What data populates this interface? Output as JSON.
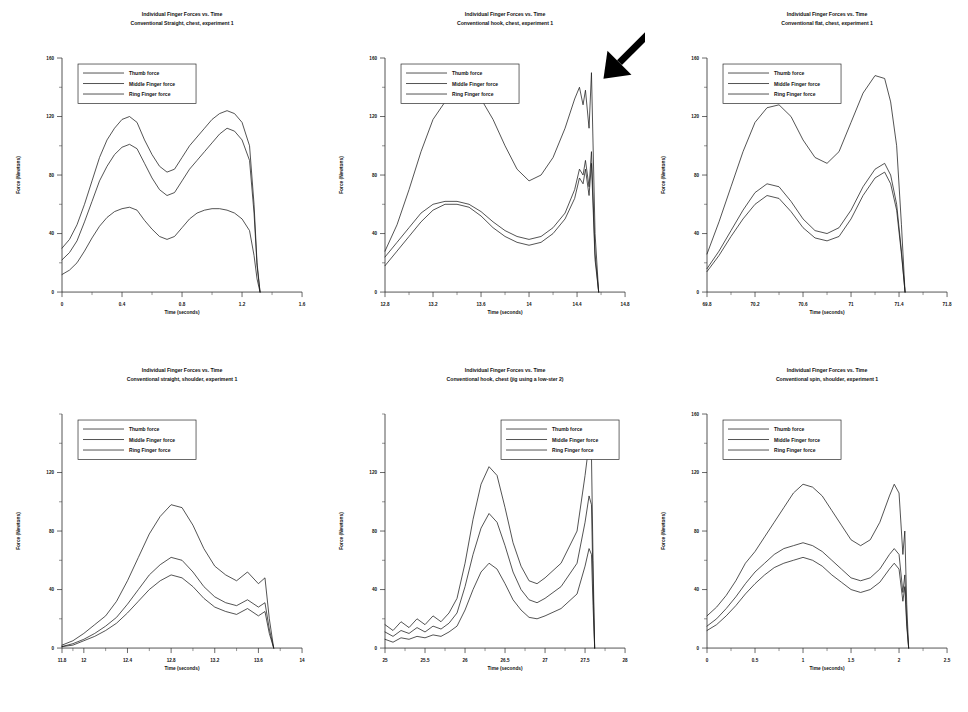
{
  "figure": {
    "caption_shared": {
      "title_line1": "Individual Finger Forces vs. Time",
      "ylabel": "Force (Newtons)",
      "xlabel": "Time (seconds)",
      "legend": [
        "Thumb force",
        "Middle Finger force",
        "Ring Finger force"
      ]
    }
  },
  "chart_data": [
    {
      "id": "panel-1",
      "type": "line",
      "title": "Individual Finger Forces vs. Time",
      "subtitle": "Conventional Straight, chest, experiment 1",
      "xlabel": "Time (seconds)",
      "ylabel": "Force (Newtons)",
      "xlim": [
        0,
        1.6
      ],
      "ylim": [
        0,
        160
      ],
      "xticks": [
        "0",
        "0.4",
        "0.8",
        "1.2",
        "1.6"
      ],
      "yticks": [
        "0",
        "40",
        "80",
        "120",
        "160"
      ],
      "grid": false,
      "legend_position": "upper-left",
      "legend": [
        "Thumb force",
        "Middle Finger force",
        "Ring Finger force"
      ],
      "x": [
        0.0,
        0.05,
        0.1,
        0.15,
        0.2,
        0.25,
        0.3,
        0.35,
        0.4,
        0.45,
        0.5,
        0.55,
        0.6,
        0.65,
        0.7,
        0.75,
        0.8,
        0.85,
        0.9,
        0.95,
        1.0,
        1.05,
        1.1,
        1.15,
        1.2,
        1.25,
        1.28,
        1.3,
        1.32
      ],
      "series": [
        {
          "name": "Thumb force",
          "values": [
            30,
            36,
            46,
            60,
            76,
            92,
            104,
            112,
            118,
            120,
            116,
            104,
            94,
            86,
            82,
            84,
            92,
            100,
            106,
            112,
            118,
            122,
            124,
            122,
            116,
            100,
            60,
            20,
            0
          ]
        },
        {
          "name": "Middle Finger force",
          "values": [
            22,
            27,
            35,
            48,
            62,
            76,
            86,
            94,
            99,
            101,
            98,
            88,
            78,
            70,
            66,
            68,
            76,
            84,
            90,
            96,
            102,
            108,
            112,
            110,
            104,
            90,
            54,
            18,
            0
          ]
        },
        {
          "name": "Ring Finger force",
          "values": [
            12,
            15,
            20,
            28,
            37,
            45,
            51,
            55,
            57,
            58,
            56,
            49,
            43,
            38,
            36,
            38,
            44,
            50,
            54,
            56,
            57,
            57,
            56,
            54,
            50,
            42,
            25,
            9,
            0
          ]
        }
      ]
    },
    {
      "id": "panel-2",
      "type": "line",
      "title": "Individual Finger Forces vs. Time",
      "subtitle": "Conventional hook, chest, experiment 1",
      "xlabel": "Time (seconds)",
      "ylabel": "Force (Newtons)",
      "xlim": [
        12.8,
        14.8
      ],
      "ylim": [
        0,
        160
      ],
      "xticks": [
        "12.8",
        "13.2",
        "13.6",
        "14",
        "14.4",
        "14.8"
      ],
      "yticks": [
        "0",
        "40",
        "80",
        "120",
        "160"
      ],
      "grid": false,
      "legend_position": "upper-left",
      "legend": [
        "Thumb force",
        "Middle Finger force",
        "Ring Finger force"
      ],
      "annotation": "black arrow pointing to spike near t = 14.45 s",
      "x": [
        12.8,
        12.9,
        13.0,
        13.1,
        13.2,
        13.3,
        13.4,
        13.5,
        13.6,
        13.7,
        13.8,
        13.9,
        14.0,
        14.1,
        14.2,
        14.3,
        14.38,
        14.42,
        14.45,
        14.47,
        14.5,
        14.52,
        14.55,
        14.58
      ],
      "series": [
        {
          "name": "Thumb force",
          "values": [
            28,
            46,
            70,
            96,
            118,
            130,
            136,
            138,
            132,
            118,
            100,
            84,
            76,
            80,
            92,
            112,
            132,
            140,
            128,
            138,
            112,
            150,
            40,
            0
          ]
        },
        {
          "name": "Middle Finger force",
          "values": [
            24,
            34,
            44,
            54,
            60,
            62,
            62,
            60,
            55,
            48,
            42,
            38,
            36,
            38,
            44,
            54,
            70,
            84,
            80,
            90,
            72,
            96,
            26,
            0
          ]
        },
        {
          "name": "Ring Finger force",
          "values": [
            18,
            28,
            38,
            48,
            56,
            60,
            60,
            58,
            52,
            44,
            38,
            34,
            32,
            34,
            40,
            50,
            64,
            78,
            74,
            84,
            66,
            88,
            22,
            0
          ]
        }
      ]
    },
    {
      "id": "panel-3",
      "type": "line",
      "title": "Individual Finger Forces vs. Time",
      "subtitle": "Conventional flat, chest, experiment 1",
      "xlabel": "Time (seconds)",
      "ylabel": "Force (Newtons)",
      "xlim": [
        69.8,
        71.8
      ],
      "ylim": [
        0,
        160
      ],
      "xticks": [
        "69.8",
        "70.2",
        "70.6",
        "71",
        "71.4",
        "71.8"
      ],
      "yticks": [
        "0",
        "40",
        "80",
        "120",
        "160"
      ],
      "grid": false,
      "legend_position": "upper-left",
      "legend": [
        "Thumb force",
        "Middle Finger force",
        "Ring Finger force"
      ],
      "x": [
        69.8,
        69.9,
        70.0,
        70.1,
        70.2,
        70.3,
        70.4,
        70.5,
        70.6,
        70.7,
        70.8,
        70.9,
        71.0,
        71.1,
        71.2,
        71.28,
        71.33,
        71.38,
        71.42,
        71.45
      ],
      "series": [
        {
          "name": "Thumb force",
          "values": [
            26,
            48,
            72,
            96,
            116,
            126,
            128,
            120,
            104,
            92,
            88,
            96,
            116,
            136,
            148,
            146,
            130,
            100,
            46,
            0
          ]
        },
        {
          "name": "Middle Finger force",
          "values": [
            16,
            28,
            42,
            56,
            68,
            74,
            72,
            62,
            50,
            42,
            40,
            44,
            56,
            72,
            84,
            88,
            80,
            60,
            28,
            0
          ]
        },
        {
          "name": "Ring Finger force",
          "values": [
            14,
            25,
            38,
            50,
            60,
            66,
            64,
            55,
            44,
            37,
            35,
            38,
            50,
            66,
            78,
            82,
            74,
            56,
            26,
            0
          ]
        }
      ]
    },
    {
      "id": "panel-4",
      "type": "line",
      "title": "Individual Finger Forces vs. Time",
      "subtitle": "Conventional straight, shoulder, experiment 1",
      "xlabel": "Time (seconds)",
      "ylabel": "Force (Newtons)",
      "xlim": [
        11.8,
        14.0
      ],
      "ylim": [
        0,
        160
      ],
      "xticks": [
        "11.8",
        "12",
        "12.4",
        "12.8",
        "13.2",
        "13.6",
        "14"
      ],
      "yticks": [
        "0",
        "40",
        "80",
        "120"
      ],
      "grid": false,
      "legend_position": "upper-left",
      "legend": [
        "Thumb force",
        "Middle Finger force",
        "Ring Finger force"
      ],
      "x": [
        11.8,
        11.9,
        12.0,
        12.1,
        12.2,
        12.3,
        12.4,
        12.5,
        12.6,
        12.7,
        12.8,
        12.9,
        13.0,
        13.1,
        13.2,
        13.3,
        13.4,
        13.5,
        13.6,
        13.66,
        13.7,
        13.74
      ],
      "series": [
        {
          "name": "Thumb force",
          "values": [
            2,
            5,
            10,
            16,
            22,
            32,
            46,
            62,
            78,
            90,
            98,
            96,
            84,
            68,
            56,
            50,
            46,
            52,
            44,
            48,
            20,
            0
          ]
        },
        {
          "name": "Middle Finger force",
          "values": [
            1,
            3,
            6,
            10,
            15,
            21,
            30,
            40,
            50,
            57,
            62,
            60,
            52,
            42,
            35,
            31,
            29,
            33,
            28,
            31,
            13,
            0
          ]
        },
        {
          "name": "Ring Finger force",
          "values": [
            1,
            2,
            5,
            8,
            12,
            17,
            24,
            32,
            40,
            46,
            50,
            48,
            42,
            34,
            28,
            25,
            23,
            27,
            22,
            25,
            10,
            0
          ]
        }
      ]
    },
    {
      "id": "panel-5",
      "type": "line",
      "title": "Individual Finger Forces vs. Time",
      "subtitle": "Conventional hook, chest (jig using a low-ster 2)",
      "xlabel": "Time (seconds)",
      "ylabel": "Force (Newtons)",
      "xlim": [
        25.0,
        28.0
      ],
      "ylim": [
        0,
        160
      ],
      "xticks": [
        "25",
        "25.5",
        "26",
        "26.5",
        "27",
        "27.5",
        "28"
      ],
      "yticks": [
        "0",
        "40",
        "80",
        "120"
      ],
      "grid": false,
      "legend_position": "upper-right",
      "legend": [
        "Thumb force",
        "Middle Finger force",
        "Ring Finger force"
      ],
      "x": [
        25.0,
        25.1,
        25.2,
        25.3,
        25.4,
        25.5,
        25.6,
        25.7,
        25.8,
        25.9,
        26.0,
        26.1,
        26.2,
        26.3,
        26.4,
        26.5,
        26.6,
        26.7,
        26.8,
        26.9,
        27.0,
        27.2,
        27.4,
        27.5,
        27.55,
        27.58,
        27.6,
        27.62
      ],
      "series": [
        {
          "name": "Thumb force",
          "values": [
            16,
            12,
            18,
            14,
            20,
            16,
            22,
            18,
            24,
            34,
            58,
            88,
            112,
            124,
            118,
            96,
            72,
            56,
            46,
            44,
            48,
            58,
            80,
            118,
            140,
            132,
            60,
            0
          ]
        },
        {
          "name": "Middle Finger force",
          "values": [
            11,
            8,
            12,
            10,
            14,
            11,
            15,
            13,
            17,
            24,
            42,
            64,
            82,
            92,
            86,
            70,
            52,
            40,
            33,
            31,
            34,
            42,
            58,
            86,
            104,
            98,
            44,
            0
          ]
        },
        {
          "name": "Ring Finger force",
          "values": [
            6,
            4,
            7,
            6,
            8,
            7,
            9,
            8,
            11,
            15,
            26,
            40,
            52,
            58,
            54,
            44,
            33,
            26,
            21,
            20,
            22,
            27,
            37,
            56,
            68,
            64,
            29,
            0
          ]
        }
      ]
    },
    {
      "id": "panel-6",
      "type": "line",
      "title": "Individual Finger Forces vs. Time",
      "subtitle": "Conventional spin, shoulder, experiment 1",
      "xlabel": "Time (seconds)",
      "ylabel": "Force (Newtons)",
      "xlim": [
        0,
        2.5
      ],
      "ylim": [
        0,
        160
      ],
      "xticks": [
        "0",
        "0.5",
        "1",
        "1.5",
        "2",
        "2.5"
      ],
      "yticks": [
        "0",
        "40",
        "80",
        "120",
        "160"
      ],
      "grid": false,
      "legend_position": "upper-left",
      "legend": [
        "Thumb force",
        "Middle Finger force",
        "Ring Finger force"
      ],
      "x": [
        0.0,
        0.1,
        0.2,
        0.3,
        0.4,
        0.5,
        0.6,
        0.7,
        0.8,
        0.9,
        1.0,
        1.1,
        1.2,
        1.3,
        1.4,
        1.5,
        1.6,
        1.7,
        1.8,
        1.9,
        1.95,
        2.0,
        2.04,
        2.06,
        2.08,
        2.1
      ],
      "series": [
        {
          "name": "Thumb force",
          "values": [
            22,
            28,
            36,
            46,
            58,
            66,
            76,
            86,
            96,
            106,
            112,
            110,
            104,
            94,
            84,
            74,
            70,
            74,
            86,
            104,
            112,
            106,
            64,
            80,
            30,
            0
          ]
        },
        {
          "name": "Middle Finger force",
          "values": [
            15,
            20,
            27,
            35,
            44,
            52,
            58,
            64,
            68,
            70,
            72,
            70,
            66,
            60,
            54,
            48,
            46,
            48,
            54,
            64,
            68,
            64,
            38,
            50,
            18,
            0
          ]
        },
        {
          "name": "Ring Finger force",
          "values": [
            12,
            16,
            22,
            29,
            37,
            44,
            50,
            55,
            58,
            60,
            62,
            60,
            56,
            50,
            45,
            40,
            38,
            40,
            45,
            54,
            58,
            54,
            32,
            42,
            15,
            0
          ]
        }
      ]
    }
  ]
}
